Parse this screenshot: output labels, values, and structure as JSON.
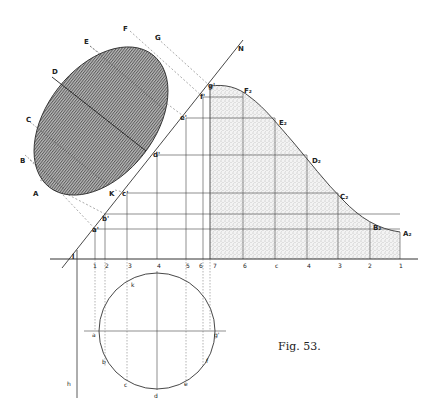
{
  "figure": {
    "caption": "Fig. 53.",
    "ellipse_labels": [
      {
        "id": "A",
        "text": "A",
        "x": 33,
        "y": 196
      },
      {
        "id": "B",
        "text": "B",
        "x": 20,
        "y": 163
      },
      {
        "id": "C",
        "text": "C",
        "x": 26,
        "y": 122
      },
      {
        "id": "D",
        "text": "D",
        "x": 52,
        "y": 74
      },
      {
        "id": "E",
        "text": "E",
        "x": 84,
        "y": 44
      },
      {
        "id": "F",
        "text": "F",
        "x": 123,
        "y": 31
      },
      {
        "id": "G",
        "text": "G",
        "x": 155,
        "y": 40
      },
      {
        "id": "K",
        "text": "K",
        "x": 109,
        "y": 196
      }
    ],
    "axis_labels": [
      {
        "id": "N",
        "text": "N",
        "x": 238,
        "y": 51
      },
      {
        "id": "a1",
        "text": "a'",
        "x": 92,
        "y": 232
      },
      {
        "id": "b1",
        "text": "b'",
        "x": 102,
        "y": 221
      },
      {
        "id": "c1",
        "text": "c'",
        "x": 122,
        "y": 196
      },
      {
        "id": "d1",
        "text": "d'",
        "x": 153,
        "y": 157
      },
      {
        "id": "e1",
        "text": "e'",
        "x": 180,
        "y": 120
      },
      {
        "id": "f1",
        "text": "f'",
        "x": 200,
        "y": 99
      },
      {
        "id": "g1",
        "text": "g'",
        "x": 208,
        "y": 88
      },
      {
        "id": "l",
        "text": "l",
        "x": 72,
        "y": 259
      }
    ],
    "curve_labels": [
      {
        "id": "F2",
        "text": "F₂",
        "x": 244,
        "y": 93
      },
      {
        "id": "E2",
        "text": "E₂",
        "x": 279,
        "y": 125
      },
      {
        "id": "D2",
        "text": "D₂",
        "x": 312,
        "y": 163
      },
      {
        "id": "C2",
        "text": "C₂",
        "x": 340,
        "y": 199
      },
      {
        "id": "B2",
        "text": "B₂",
        "x": 373,
        "y": 230
      },
      {
        "id": "A2",
        "text": "A₂",
        "x": 403,
        "y": 236
      }
    ],
    "ground_ticks_left": [
      {
        "text": "1",
        "x": 93,
        "y": 268
      },
      {
        "text": "2",
        "x": 105,
        "y": 268
      },
      {
        "text": "3",
        "x": 128,
        "y": 268
      },
      {
        "text": "4",
        "x": 157,
        "y": 268
      },
      {
        "text": "5",
        "x": 186,
        "y": 268
      },
      {
        "text": "6",
        "x": 199,
        "y": 268
      },
      {
        "text": "7",
        "x": 213,
        "y": 268
      }
    ],
    "ground_ticks_right": [
      {
        "text": "6",
        "x": 243,
        "y": 268
      },
      {
        "text": "c",
        "x": 275,
        "y": 268
      },
      {
        "text": "4",
        "x": 307,
        "y": 268
      },
      {
        "text": "3",
        "x": 338,
        "y": 268
      },
      {
        "text": "2",
        "x": 368,
        "y": 268
      },
      {
        "text": "1",
        "x": 399,
        "y": 268
      }
    ],
    "circle_labels": [
      {
        "id": "k",
        "text": "k",
        "x": 131,
        "y": 287
      },
      {
        "id": "a",
        "text": "a",
        "x": 92,
        "y": 337
      },
      {
        "id": "b",
        "text": "b",
        "x": 102,
        "y": 364
      },
      {
        "id": "c",
        "text": "c",
        "x": 124,
        "y": 387
      },
      {
        "id": "d",
        "text": "d",
        "x": 154,
        "y": 398
      },
      {
        "id": "e",
        "text": "e",
        "x": 184,
        "y": 386
      },
      {
        "id": "f",
        "text": "f",
        "x": 206,
        "y": 363
      },
      {
        "id": "g",
        "text": "g'",
        "x": 214,
        "y": 337
      },
      {
        "id": "h",
        "text": "h",
        "x": 67,
        "y": 386
      }
    ]
  }
}
